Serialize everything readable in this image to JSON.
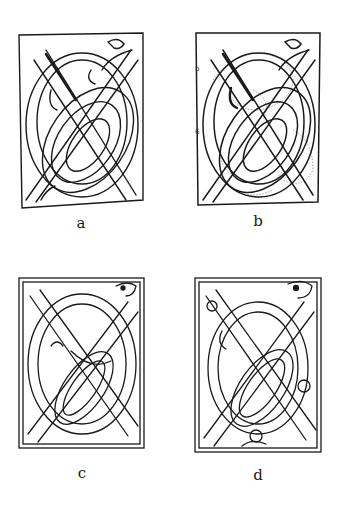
{
  "figure": {
    "panels": [
      {
        "id": "a",
        "label": "a",
        "stage": "pencil construction lines"
      },
      {
        "id": "b",
        "label": "b",
        "stage": "construction with dotted guides",
        "side_labels": [
          "b",
          "6"
        ]
      },
      {
        "id": "c",
        "label": "c",
        "stage": "double-line interlace"
      },
      {
        "id": "d",
        "label": "d",
        "stage": "finished interlace with additional knots"
      }
    ]
  },
  "colors": {
    "ink": "#1a1a1a",
    "guide": "#888888",
    "background": "#ffffff"
  }
}
